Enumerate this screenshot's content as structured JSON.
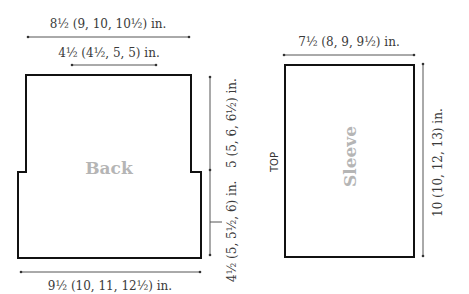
{
  "back": {
    "label": "Back",
    "top_width": "8½ (9, 10, 10½) in.",
    "neck_width": "4½ (4½, 5, 5) in.",
    "bottom_width": "9½ (10, 11, 12½) in.",
    "upper_height": "5 (5, 6, 6½) in.",
    "lower_height": "4½ (5, 5½, 6) in."
  },
  "sleeve": {
    "label": "Sleeve",
    "top_marker": "TOP",
    "width": "7½ (8, 9, 9½) in.",
    "length": "10 (10, 12, 13) in."
  },
  "colors": {
    "outline": "#111111",
    "dimension_line": "#555555",
    "piece_label": "#b5b5b5"
  }
}
